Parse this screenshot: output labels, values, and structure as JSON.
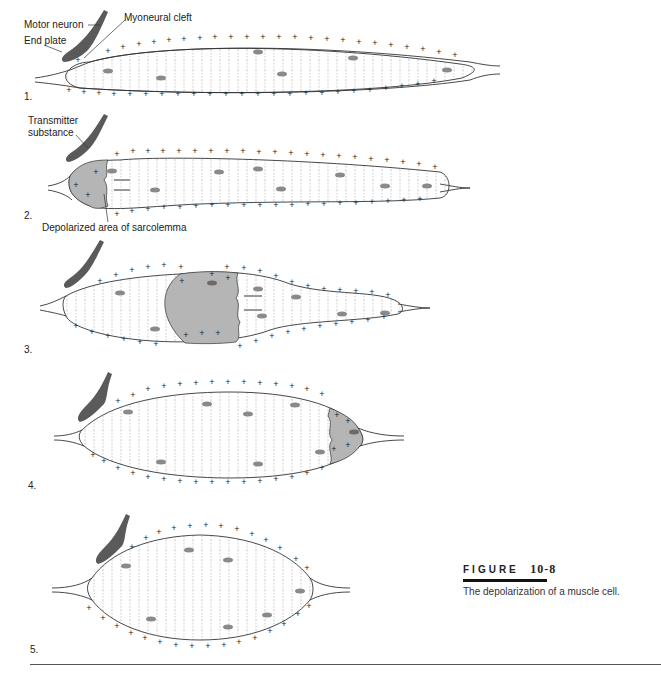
{
  "labels": {
    "motor_neuron": "Motor neuron",
    "myoneural_cleft": "Myoneural cleft",
    "end_plate": "End plate",
    "transmitter_substance_line1": "Transmitter",
    "transmitter_substance_line2": "substance",
    "depolarized_area": "Depolarized area of sarcolemma"
  },
  "panels": [
    {
      "number": "1.",
      "state": "resting (polarized)"
    },
    {
      "number": "2.",
      "state": "depolarization begins at end plate"
    },
    {
      "number": "3.",
      "state": "depolarization wave spreading"
    },
    {
      "number": "4.",
      "state": "depolarization near far end"
    },
    {
      "number": "5.",
      "state": "repolarized"
    }
  ],
  "caption": {
    "figure_word": "FIGURE",
    "figure_number": "10-8",
    "description": "The depolarization of a muscle cell."
  },
  "colors": {
    "neuron": "#5a5a5a",
    "nucleus": "#8a8a8a",
    "depolarized": "#b5b5b5",
    "outline": "#333333"
  }
}
